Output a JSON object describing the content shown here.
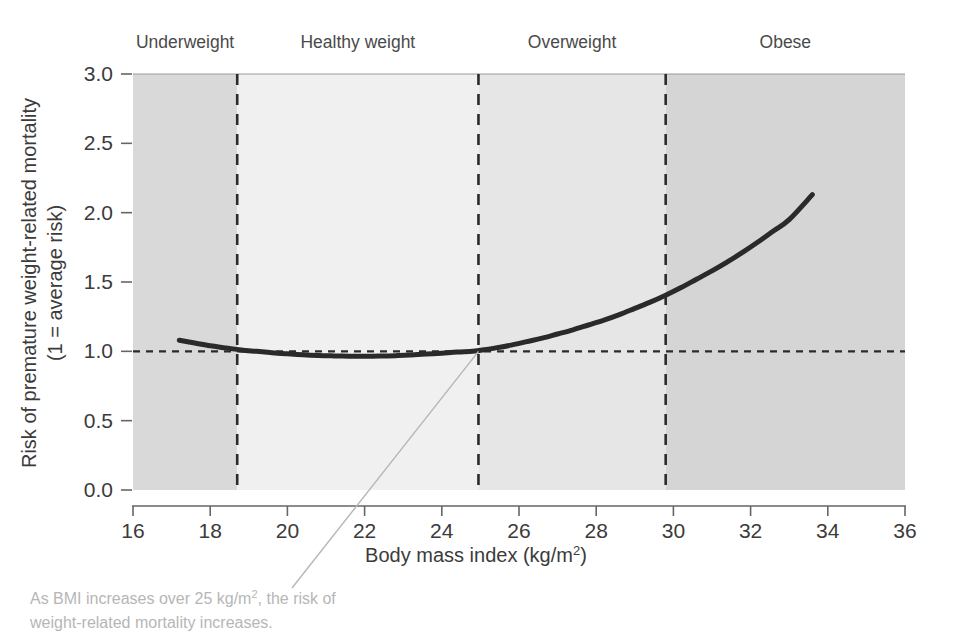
{
  "chart_data": {
    "type": "line",
    "title": "",
    "xlabel": "Body mass index (kg/m2)",
    "xlabel_base": "Body mass index (kg/m",
    "xlabel_sup": "2",
    "xlabel_tail": ")",
    "ylabel_line1": "Risk of premature weight-related mortality",
    "ylabel_line2": "(1 = average risk)",
    "xlim": [
      16,
      36
    ],
    "ylim": [
      0.0,
      3.0
    ],
    "xticks": [
      16,
      18,
      20,
      22,
      24,
      26,
      28,
      30,
      32,
      34,
      36
    ],
    "xtick_labels": [
      "16",
      "18",
      "20",
      "22",
      "24",
      "26",
      "28",
      "30",
      "32",
      "34",
      "36"
    ],
    "yticks": [
      0.0,
      0.5,
      1.0,
      1.5,
      2.0,
      2.5,
      3.0
    ],
    "ytick_labels": [
      "0.0",
      "0.5",
      "1.0",
      "1.5",
      "2.0",
      "2.5",
      "3.0"
    ],
    "grid": false,
    "legend_position": "none",
    "series": [
      {
        "name": "Risk of premature weight-related mortality",
        "color": "#2a2a2a",
        "line_width": 5,
        "x": [
          17.2,
          17.6,
          18.0,
          18.4,
          18.8,
          19.2,
          19.6,
          20.0,
          20.4,
          20.8,
          21.2,
          21.6,
          22.0,
          22.4,
          22.8,
          23.2,
          23.6,
          24.0,
          24.4,
          24.8,
          25.0,
          25.4,
          25.8,
          26.2,
          26.6,
          27.0,
          27.4,
          27.8,
          28.2,
          28.6,
          29.0,
          29.4,
          29.8,
          30.2,
          30.6,
          31.0,
          31.4,
          31.8,
          32.2,
          32.6,
          33.0,
          33.6
        ],
        "y": [
          1.08,
          1.06,
          1.04,
          1.025,
          1.01,
          1.0,
          0.99,
          0.982,
          0.975,
          0.97,
          0.967,
          0.965,
          0.965,
          0.966,
          0.969,
          0.974,
          0.98,
          0.987,
          0.995,
          1.0,
          1.008,
          1.025,
          1.045,
          1.07,
          1.095,
          1.125,
          1.155,
          1.19,
          1.225,
          1.265,
          1.31,
          1.355,
          1.405,
          1.46,
          1.52,
          1.58,
          1.645,
          1.715,
          1.79,
          1.87,
          1.95,
          2.13
        ]
      }
    ],
    "reference_line": {
      "name": "average-risk-line",
      "value": 1.0,
      "orientation": "horizontal",
      "style": "dashed",
      "color": "#2b2b2b"
    },
    "category_bands": [
      {
        "name": "Underweight",
        "label": "Underweight",
        "x_start": 16,
        "x_end": 18.7,
        "fill": "#d9d9d9"
      },
      {
        "name": "Healthy weight",
        "label": "Healthy weight",
        "x_start": 18.7,
        "x_end": 24.95,
        "fill": "#f0f0f0"
      },
      {
        "name": "Overweight",
        "label": "Overweight",
        "x_start": 24.95,
        "x_end": 29.8,
        "fill": "#e6e6e6"
      },
      {
        "name": "Obese",
        "label": "Obese",
        "x_start": 29.8,
        "x_end": 36,
        "fill": "#d5d5d5"
      }
    ],
    "band_dividers": [
      {
        "name": "underweight-healthy-divider",
        "value": 18.7
      },
      {
        "name": "healthy-overweight-divider",
        "value": 24.95
      },
      {
        "name": "overweight-obese-divider",
        "value": 29.8
      }
    ],
    "annotation": {
      "name": "bmi-risk-annotation",
      "line1": "As BMI increases over 25 kg/m2, the risk of",
      "line1_a": "As BMI increases over 25 kg/m",
      "line1_sup": "2",
      "line1_b": ", the risk of",
      "line2": "weight-related mortality increases.",
      "leader_from": {
        "x": 24.95,
        "y": 1.0
      },
      "color": "#b6b6b6"
    },
    "colors": {
      "curve": "#2a2a2a",
      "axis": "#555555",
      "tick_text": "#3b3b3b",
      "band_underweight": "#d9d9d9",
      "band_healthy": "#f0f0f0",
      "band_overweight": "#e6e6e6",
      "band_obese": "#d5d5d5",
      "annotation": "#b6b6b6"
    }
  }
}
